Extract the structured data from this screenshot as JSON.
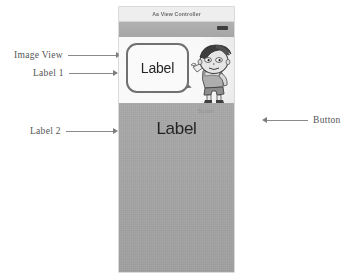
{
  "annotations": [
    {
      "id": "image-view",
      "label": "Image View",
      "direction": "right"
    },
    {
      "id": "label1",
      "label": "Label 1",
      "direction": "right"
    },
    {
      "id": "label2",
      "label": "Label 2",
      "direction": "right"
    },
    {
      "id": "button",
      "label": "Button",
      "direction": "left"
    }
  ],
  "simulator": {
    "navbar": {
      "title": "Aa View Controller"
    },
    "toolstrip": {
      "button_name": "nav-bar-button"
    },
    "image_view": {
      "bubble_text": "Label",
      "character": "cartoon-boy"
    },
    "body": {
      "label_text": "Label",
      "button_text": "Button"
    }
  },
  "colors": {
    "page_background": "#ffffff",
    "annotation_text": "#555555",
    "arrow": "#8a8a8a",
    "navbar_background": "#f3f3f3",
    "navbar_title": "#6a6a6a",
    "toolstrip": "#ababab",
    "body_background": "#a6a6a6",
    "label_text": "#1f1f1f",
    "bubble_border": "#6f6f6f",
    "bubble_fill": "#ffffff"
  }
}
